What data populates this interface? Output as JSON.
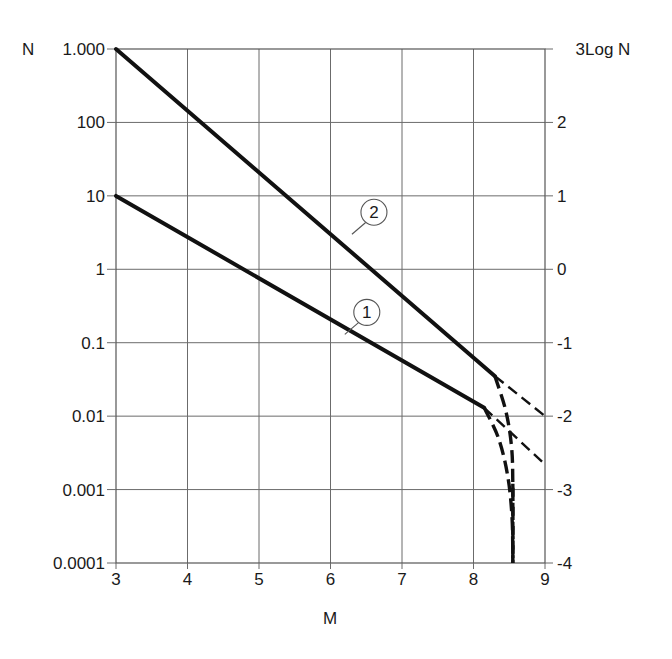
{
  "chart_data": {
    "type": "line",
    "title": "",
    "xlabel": "M",
    "ylabel_left": "N",
    "ylabel_right": "Log N",
    "xlim": [
      3,
      9
    ],
    "ylim_log10": [
      -4,
      3
    ],
    "y_scale": "log",
    "grid": true,
    "x_ticks": [
      3,
      4,
      5,
      6,
      7,
      8,
      9
    ],
    "x_tick_labels": [
      "3",
      "4",
      "5",
      "6",
      "7",
      "8",
      "9"
    ],
    "y_left_ticks_log10": [
      3,
      2,
      1,
      0,
      -1,
      -2,
      -3,
      -4
    ],
    "y_left_tick_labels": [
      "1.000",
      "100",
      "10",
      "1",
      "0.1",
      "0.01",
      "0.001",
      "0.0001"
    ],
    "y_right_tick_labels": [
      "3",
      "2",
      "1",
      "0",
      "-1",
      "-2",
      "-3",
      "-4"
    ],
    "series": [
      {
        "name": "1",
        "style": "solid",
        "x": [
          3,
          8.15
        ],
        "y": [
          10,
          0.013
        ],
        "continuation_linear": {
          "style": "dashed",
          "x": [
            8.15,
            9
          ],
          "y": [
            0.013,
            0.0022
          ]
        },
        "continuation_cutoff": {
          "style": "dashed",
          "x": [
            8.15,
            8.35,
            8.48,
            8.54,
            8.55
          ],
          "y": [
            0.013,
            0.005,
            0.0015,
            0.0004,
            0.0001
          ]
        }
      },
      {
        "name": "2",
        "style": "solid",
        "x": [
          3,
          8.3
        ],
        "y": [
          1000,
          0.035
        ],
        "continuation_linear": {
          "style": "dashed",
          "x": [
            8.3,
            9
          ],
          "y": [
            0.035,
            0.01
          ]
        },
        "continuation_cutoff": {
          "style": "dashed",
          "x": [
            8.3,
            8.45,
            8.53,
            8.55,
            8.55
          ],
          "y": [
            0.035,
            0.012,
            0.004,
            0.0012,
            0.0001
          ]
        }
      }
    ],
    "maximum_magnitude_line": {
      "style": "dashed",
      "x": 8.55
    },
    "annotations": [
      {
        "label": "1",
        "near_series": "1",
        "x": 6.2,
        "y": 0.13
      },
      {
        "label": "2",
        "near_series": "2",
        "x": 6.3,
        "y": 3.0
      }
    ]
  }
}
